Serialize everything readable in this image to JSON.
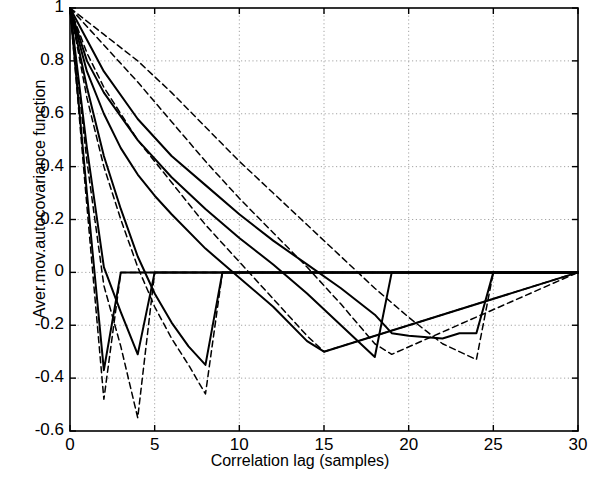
{
  "chart_data": {
    "type": "line",
    "title": "",
    "xlabel": "Correlation lag (samples)",
    "ylabel": "Aver.mov.autocovariance function",
    "xlim": [
      0,
      30
    ],
    "ylim": [
      -0.6,
      1.0
    ],
    "xticks": [
      0,
      5,
      10,
      15,
      20,
      25,
      30
    ],
    "xtick_labels": [
      "0",
      "5",
      "10",
      "15",
      "20",
      "25",
      "30"
    ],
    "yticks": [
      -0.6,
      -0.4,
      -0.2,
      0,
      0.2,
      0.4,
      0.6,
      0.8,
      1
    ],
    "ytick_labels": [
      "-0.6",
      "-0.4",
      "-0.2",
      "0",
      "0.2",
      "0.4",
      "0.6",
      "0.8",
      "1"
    ],
    "grid": "dotted",
    "legend": "none",
    "line_color": "#000000",
    "series": [
      {
        "name": "solid-1",
        "style": "solid",
        "x": [
          0,
          1,
          2,
          3,
          4,
          30
        ],
        "values": [
          1,
          0.3,
          -0.37,
          0,
          0,
          0
        ]
      },
      {
        "name": "solid-2",
        "style": "solid",
        "x": [
          0,
          1,
          2,
          3,
          4,
          5,
          6,
          30
        ],
        "values": [
          1,
          0.47,
          0.02,
          -0.15,
          -0.31,
          0,
          0,
          0
        ]
      },
      {
        "name": "solid-3",
        "style": "solid",
        "x": [
          0,
          1,
          2,
          3,
          4,
          5,
          6,
          7,
          8,
          9,
          30
        ],
        "values": [
          1,
          0.7,
          0.44,
          0.24,
          0.06,
          -0.08,
          -0.19,
          -0.28,
          -0.35,
          0,
          0
        ]
      },
      {
        "name": "solid-4",
        "style": "solid",
        "x": [
          0,
          1,
          2,
          3,
          4,
          5,
          6,
          8,
          10,
          12,
          14,
          15,
          30
        ],
        "values": [
          1,
          0.76,
          0.6,
          0.47,
          0.37,
          0.29,
          0.22,
          0.09,
          -0.02,
          -0.13,
          -0.26,
          -0.3,
          0
        ]
      },
      {
        "name": "solid-5",
        "style": "solid",
        "x": [
          0,
          1,
          2,
          4,
          6,
          8,
          10,
          12,
          14,
          16,
          18,
          19,
          30
        ],
        "values": [
          1,
          0.8,
          0.68,
          0.5,
          0.36,
          0.24,
          0.13,
          0.03,
          -0.08,
          -0.2,
          -0.32,
          0,
          0
        ]
      },
      {
        "name": "solid-6",
        "style": "solid",
        "x": [
          0,
          2,
          4,
          6,
          8,
          10,
          12,
          14,
          16,
          18,
          19,
          20,
          22,
          23,
          24,
          25,
          30
        ],
        "values": [
          1,
          0.76,
          0.58,
          0.44,
          0.33,
          0.22,
          0.12,
          0.03,
          -0.06,
          -0.16,
          -0.23,
          -0.24,
          -0.25,
          -0.23,
          -0.23,
          0,
          0
        ]
      },
      {
        "name": "dashed-1",
        "style": "dashed",
        "x": [
          0,
          1,
          2,
          3,
          4,
          30
        ],
        "values": [
          1,
          0.25,
          -0.48,
          0,
          0,
          0
        ]
      },
      {
        "name": "dashed-2",
        "style": "dashed",
        "x": [
          0,
          1,
          2,
          3,
          4,
          5,
          30
        ],
        "values": [
          1,
          0.42,
          -0.05,
          -0.28,
          -0.55,
          0,
          0
        ]
      },
      {
        "name": "dashed-3",
        "style": "dashed",
        "x": [
          0,
          1,
          2,
          3,
          4,
          5,
          6,
          7,
          8,
          9,
          30
        ],
        "values": [
          1,
          0.66,
          0.4,
          0.2,
          0.02,
          -0.13,
          -0.25,
          -0.35,
          -0.46,
          0,
          0
        ]
      },
      {
        "name": "dashed-4",
        "style": "dashed",
        "x": [
          0,
          1,
          2,
          4,
          6,
          8,
          10,
          12,
          14,
          15,
          30
        ],
        "values": [
          1,
          0.83,
          0.7,
          0.5,
          0.34,
          0.18,
          0.04,
          -0.1,
          -0.24,
          -0.3,
          0
        ]
      },
      {
        "name": "dashed-5",
        "style": "dashed",
        "x": [
          0,
          2,
          4,
          6,
          8,
          10,
          12,
          14,
          16,
          18,
          19,
          30
        ],
        "values": [
          1,
          0.86,
          0.72,
          0.57,
          0.42,
          0.28,
          0.15,
          0.02,
          -0.12,
          -0.27,
          -0.31,
          0
        ]
      },
      {
        "name": "dashed-6",
        "style": "dashed",
        "x": [
          0,
          2,
          4,
          6,
          8,
          10,
          12,
          14,
          16,
          18,
          20,
          22,
          24,
          25,
          30
        ],
        "values": [
          1,
          0.9,
          0.8,
          0.68,
          0.55,
          0.42,
          0.3,
          0.18,
          0.06,
          -0.06,
          -0.17,
          -0.27,
          -0.33,
          0,
          0
        ]
      }
    ]
  }
}
